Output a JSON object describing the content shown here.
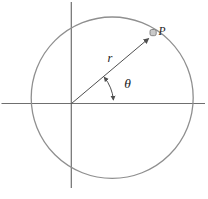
{
  "figure": {
    "type": "geometry-diagram",
    "labels": {
      "point": "P",
      "radius": "r",
      "angle": "θ"
    },
    "colors": {
      "background": "#ffffff",
      "circle": "#8f8f8f",
      "axes": "#6f6f6f",
      "vector": "#4f4f4f",
      "arc": "#4f4f4f",
      "text": "#222222",
      "dot_fill": "#c9c9c9",
      "dot_stroke": "#7d7d7d"
    }
  }
}
